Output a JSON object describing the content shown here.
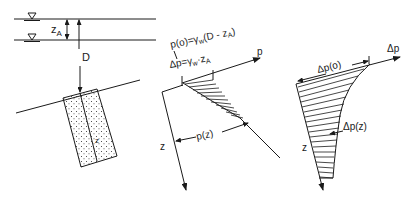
{
  "figure": {
    "left_panel": {
      "water_levels": [
        "upper-water-level",
        "lower-water-level"
      ],
      "labels": {
        "z_a": "z",
        "z_a_sub": "A",
        "depth": "D"
      }
    },
    "middle_panel": {
      "labels": {
        "p0_formula_prefix": "p(o)=γ",
        "p0_formula_sub": "w",
        "p0_formula_suffix": "(D - z",
        "p0_formula_sub2": "A",
        "p0_formula_end": ")",
        "dp_formula_prefix": "Δp=γ",
        "dp_formula_sub": "w",
        "dp_formula_suffix": "·z",
        "dp_formula_sub2": "A",
        "axis_p": "p",
        "axis_z": "z",
        "pz": "p(z)"
      }
    },
    "right_panel": {
      "labels": {
        "axis_dp": "Δp",
        "dp0": "Δp(o)",
        "dpz": "Δp(z)",
        "axis_z": "z"
      }
    }
  }
}
